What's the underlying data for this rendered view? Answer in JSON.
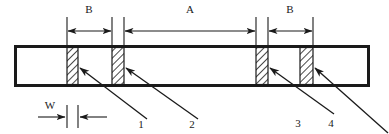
{
  "diagram": {
    "type": "engineering-cross-section",
    "colors": {
      "line": "#1a1a1a",
      "body_fill": "#ffffff",
      "hatch": "#1a1a1a",
      "hatch_fill": "#ffffff"
    },
    "dimension_labels": {
      "span_b_left": "B",
      "span_a": "A",
      "span_b_right": "B",
      "width_w": "W"
    },
    "callouts": [
      {
        "id": "1",
        "label": "1"
      },
      {
        "id": "2",
        "label": "2"
      },
      {
        "id": "3",
        "label": "3"
      },
      {
        "id": "4",
        "label": "4"
      }
    ],
    "body": {
      "x": 14,
      "y": 45,
      "width": 356,
      "height": 42,
      "stroke_width": 3
    },
    "blocks": [
      {
        "name": "block-1",
        "x": 67,
        "y": 46,
        "width": 11,
        "height": 40
      },
      {
        "name": "block-2",
        "x": 112,
        "y": 46,
        "width": 12,
        "height": 40
      },
      {
        "name": "block-3",
        "x": 256,
        "y": 46,
        "width": 12,
        "height": 40
      },
      {
        "name": "block-4",
        "x": 300,
        "y": 46,
        "width": 13,
        "height": 40
      }
    ],
    "dimension_geometry": {
      "dim_row_y": 31,
      "ext_top_y": 17,
      "ext_bottom_y": 45,
      "b_left": {
        "x1": 67,
        "x2": 112,
        "text_x": 89,
        "text_y": 13
      },
      "a_span": {
        "x1": 124,
        "x2": 256,
        "text_x": 190,
        "text_y": 13
      },
      "b_right": {
        "x1": 268,
        "x2": 313,
        "text_x": 290,
        "text_y": 13
      },
      "w_dim": {
        "x1": 67,
        "x2": 78,
        "y": 117,
        "text_x": 50,
        "text_y": 108
      }
    },
    "leaders": [
      {
        "name": "leader-1",
        "x1": 146,
        "y1": 118,
        "x2": 79,
        "y2": 68,
        "label_x": 140,
        "label_y": 126
      },
      {
        "name": "leader-2",
        "x1": 197,
        "y1": 118,
        "x2": 125,
        "y2": 68,
        "label_x": 191,
        "label_y": 126
      },
      {
        "name": "leader-3",
        "x1": 333,
        "y1": 113,
        "x2": 269,
        "y2": 68,
        "label_x": 297,
        "label_y": 126
      },
      {
        "name": "leader-4",
        "x1": 385,
        "y1": 131,
        "x2": 314,
        "y2": 68,
        "label_x": 330,
        "label_y": 126
      }
    ]
  }
}
